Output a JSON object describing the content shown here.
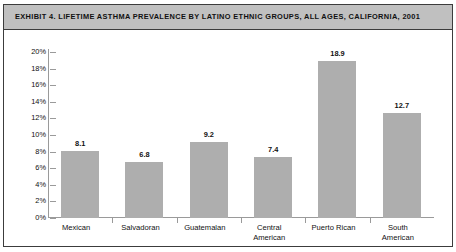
{
  "exhibit": {
    "title": "EXHIBIT 4. LIFETIME ASTHMA PREVALENCE BY LATINO ETHNIC GROUPS, ALL AGES, CALIFORNIA, 2001"
  },
  "chart_data": {
    "type": "bar",
    "title": "EXHIBIT 4. LIFETIME ASTHMA PREVALENCE BY LATINO ETHNIC GROUPS, ALL AGES, CALIFORNIA, 2001",
    "xlabel": "",
    "ylabel": "",
    "categories": [
      "Mexican",
      "Salvadoran",
      "Guatemalan",
      "Central American",
      "Puerto Rican",
      "South American"
    ],
    "category_lines": [
      [
        "Mexican"
      ],
      [
        "Salvadoran"
      ],
      [
        "Guatemalan"
      ],
      [
        "Central",
        "American"
      ],
      [
        "Puerto Rican"
      ],
      [
        "South",
        "American"
      ]
    ],
    "values": [
      8.1,
      6.8,
      9.2,
      7.4,
      18.9,
      12.7
    ],
    "value_labels": [
      "8.1",
      "6.8",
      "9.2",
      "7.4",
      "18.9",
      "12.7"
    ],
    "ylim": [
      0,
      20
    ],
    "ytick_values": [
      20,
      18,
      16,
      14,
      12,
      10,
      8,
      6,
      4,
      2,
      0
    ],
    "ytick_labels": [
      "20%",
      "18%",
      "16%",
      "14%",
      "12%",
      "10%",
      "8%",
      "6%",
      "4%",
      "2%",
      "0%"
    ],
    "grid": false,
    "legend": "none",
    "units": "percent",
    "bar_color": "#aeaeae",
    "axis_color": "#9a9a9a",
    "title_band_color": "#c0c0c0",
    "frame_color": "#3c3c3c",
    "background_color": "#ffffff"
  }
}
